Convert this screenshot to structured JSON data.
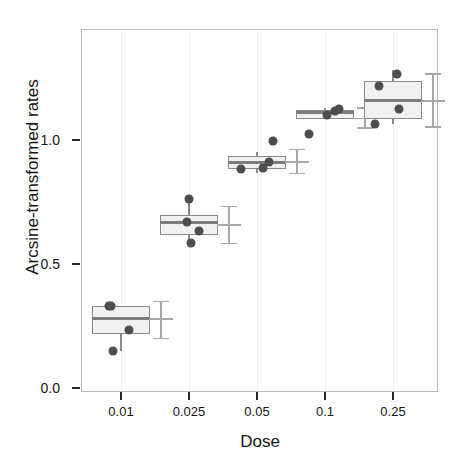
{
  "chart_data": {
    "type": "box",
    "title": "",
    "xlabel": "Dose",
    "ylabel": "Arcsine-transformed rates",
    "categories": [
      "0.01",
      "0.025",
      "0.05",
      "0.1",
      "0.25"
    ],
    "ylim": [
      0.0,
      1.45
    ],
    "yticks": [
      0.0,
      0.5,
      1.0
    ],
    "ytick_labels": [
      "0.0",
      "0.5",
      "1.0"
    ],
    "grid": "light vertical gridlines at category positions",
    "legend": "none",
    "annotations": [
      "n=4",
      "n=4",
      "n=4",
      "n=4",
      "n=4"
    ],
    "groups": [
      {
        "category": "0.01",
        "n_label": "n=4",
        "box": {
          "q1": 0.222,
          "median": 0.286,
          "q3": 0.335,
          "whisker_low": 0.153,
          "whisker_high": 0.335
        },
        "points": [
          0.153,
          0.237,
          0.335,
          0.335
        ],
        "error_bar": {
          "lower": 0.206,
          "mean": 0.286,
          "upper": 0.355
        }
      },
      {
        "category": "0.025",
        "n_label": "n=4",
        "box": {
          "q1": 0.621,
          "median": 0.673,
          "q3": 0.701,
          "whisker_low": 0.589,
          "whisker_high": 0.766
        },
        "points": [
          0.589,
          0.637,
          0.673,
          0.766
        ],
        "error_bar": {
          "lower": 0.589,
          "mean": 0.665,
          "upper": 0.738
        }
      },
      {
        "category": "0.05",
        "n_label": "n=4",
        "box": {
          "q1": 0.887,
          "median": 0.915,
          "q3": 0.939,
          "whisker_low": 0.871,
          "whisker_high": 0.955
        },
        "points": [
          0.887,
          0.891,
          0.915,
          1.0
        ],
        "error_bar": {
          "lower": 0.871,
          "mean": 0.919,
          "upper": 0.968
        }
      },
      {
        "category": "0.1",
        "n_label": "n=4",
        "box": {
          "q1": 1.089,
          "median": 1.113,
          "q3": 1.125,
          "whisker_low": 1.089,
          "whisker_high": 1.133
        },
        "points": [
          1.028,
          1.105,
          1.121,
          1.129
        ],
        "error_bar": {
          "lower": 1.056,
          "mean": 1.093,
          "upper": 1.137
        }
      },
      {
        "category": "0.25",
        "n_label": "n=4",
        "box": {
          "q1": 1.089,
          "median": 1.165,
          "q3": 1.242,
          "whisker_low": 1.069,
          "whisker_high": 1.286
        },
        "points": [
          1.069,
          1.129,
          1.222,
          1.27
        ],
        "error_bar": {
          "lower": 1.06,
          "mean": 1.165,
          "upper": 1.274
        }
      }
    ]
  },
  "axes": {
    "y_label": "Arcsine-transformed rates",
    "x_label": "Dose",
    "y_ticks": [
      {
        "label": "1.0",
        "value": 1.0
      },
      {
        "label": "0.5",
        "value": 0.5
      },
      {
        "label": "0.0",
        "value": 0.0
      }
    ],
    "x_ticks": [
      {
        "label": "0.01"
      },
      {
        "label": "0.025"
      },
      {
        "label": "0.05"
      },
      {
        "label": "0.1"
      },
      {
        "label": "0.25"
      }
    ]
  },
  "colors": {
    "box_fill": "#f0f0f0",
    "box_stroke": "#8a8a8a",
    "median": "#7d7d7d",
    "point": "#4d4d4d",
    "error_bar": "#a8a8a8",
    "panel_border": "#b9b9b9",
    "grid": "#f1f1f1",
    "text": "#141414",
    "background": "#ffffff"
  }
}
